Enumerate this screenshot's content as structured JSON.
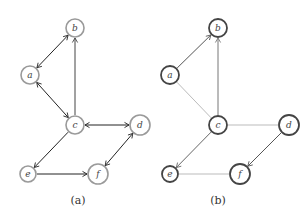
{
  "figures": [
    {
      "caption": "(a)",
      "node_style": {
        "stroke": "#9a9a9a",
        "fill": "#ffffff",
        "stroke_width": 1.6
      },
      "nodes": [
        {
          "id": "b",
          "label": "b",
          "x": 75,
          "y": 28,
          "r": 9
        },
        {
          "id": "a",
          "label": "a",
          "x": 30,
          "y": 75,
          "r": 9
        },
        {
          "id": "c",
          "label": "c",
          "x": 75,
          "y": 125,
          "r": 9
        },
        {
          "id": "d",
          "label": "d",
          "x": 140,
          "y": 125,
          "r": 10
        },
        {
          "id": "e",
          "label": "e",
          "x": 28,
          "y": 174,
          "r": 8
        },
        {
          "id": "f",
          "label": "f",
          "x": 98,
          "y": 174,
          "r": 10
        }
      ],
      "edges": [
        {
          "from": "a",
          "to": "b",
          "type": "bidirectional",
          "color": "#222222"
        },
        {
          "from": "c",
          "to": "b",
          "type": "directed",
          "color": "#444444"
        },
        {
          "from": "a",
          "to": "c",
          "type": "bidirectional",
          "color": "#222222"
        },
        {
          "from": "c",
          "to": "d",
          "type": "bidirectional",
          "color": "#222222"
        },
        {
          "from": "c",
          "to": "e",
          "type": "directed",
          "color": "#222222"
        },
        {
          "from": "e",
          "to": "f",
          "type": "directed",
          "color": "#222222"
        },
        {
          "from": "d",
          "to": "f",
          "type": "bidirectional",
          "color": "#222222"
        }
      ]
    },
    {
      "caption": "(b)",
      "node_style": {
        "stroke": "#444444",
        "fill": "#ffffff",
        "stroke_width": 1.8
      },
      "nodes": [
        {
          "id": "b",
          "label": "b",
          "x": 218,
          "y": 28,
          "r": 9
        },
        {
          "id": "a",
          "label": "a",
          "x": 170,
          "y": 75,
          "r": 9
        },
        {
          "id": "c",
          "label": "c",
          "x": 218,
          "y": 125,
          "r": 9
        },
        {
          "id": "d",
          "label": "d",
          "x": 289,
          "y": 125,
          "r": 10
        },
        {
          "id": "e",
          "label": "e",
          "x": 170,
          "y": 174,
          "r": 8
        },
        {
          "id": "f",
          "label": "f",
          "x": 240,
          "y": 174,
          "r": 10
        }
      ],
      "edges": [
        {
          "from": "a",
          "to": "b",
          "type": "directed",
          "color": "#555555"
        },
        {
          "from": "c",
          "to": "b",
          "type": "directed",
          "color": "#777777"
        },
        {
          "from": "a",
          "to": "c",
          "type": "undirected",
          "color": "#bbbbbb"
        },
        {
          "from": "c",
          "to": "d",
          "type": "undirected",
          "color": "#bbbbbb"
        },
        {
          "from": "c",
          "to": "e",
          "type": "directed",
          "color": "#666666"
        },
        {
          "from": "e",
          "to": "f",
          "type": "undirected",
          "color": "#bbbbbb"
        },
        {
          "from": "d",
          "to": "f",
          "type": "directed",
          "color": "#555555"
        }
      ]
    }
  ],
  "captions": {
    "a": "(a)",
    "b": "(b)"
  }
}
